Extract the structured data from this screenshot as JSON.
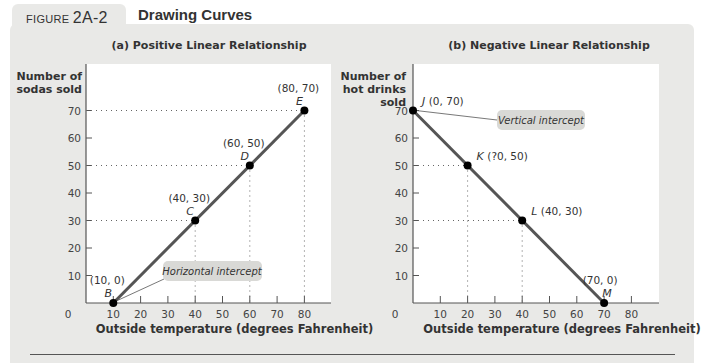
{
  "figure": {
    "label_prefix": "FIGURE",
    "label_number": "2A-2",
    "title": "Drawing Curves"
  },
  "chart_data": [
    {
      "type": "line",
      "title": "(a) Positive Linear Relationship",
      "xlabel": "Outside temperature (degrees Fahrenheit)",
      "ylabel": [
        "Number of",
        "sodas sold"
      ],
      "x_ticks": [
        0,
        10,
        20,
        30,
        40,
        50,
        60,
        70,
        80
      ],
      "y_ticks": [
        10,
        20,
        30,
        40,
        50,
        60,
        70
      ],
      "xlim": [
        0,
        90
      ],
      "ylim": [
        0,
        80
      ],
      "series": [
        {
          "name": "Sodas sold",
          "x": [
            10,
            40,
            60,
            80
          ],
          "y": [
            0,
            30,
            50,
            70
          ]
        }
      ],
      "points": [
        {
          "name": "B",
          "x": 10,
          "y": 0,
          "label": "(10, 0)"
        },
        {
          "name": "C",
          "x": 40,
          "y": 30,
          "label": "(40, 30)"
        },
        {
          "name": "D",
          "x": 60,
          "y": 50,
          "label": "(60, 50)"
        },
        {
          "name": "E",
          "x": 80,
          "y": 70,
          "label": "(80, 70)"
        }
      ],
      "annotations": [
        {
          "text": "Horizontal intercept",
          "points_to": "B"
        }
      ],
      "grid": false
    },
    {
      "type": "line",
      "title": "(b) Negative Linear Relationship",
      "xlabel": "Outside temperature (degrees Fahrenheit)",
      "ylabel": [
        "Number of",
        "hot drinks",
        "sold"
      ],
      "x_ticks": [
        0,
        10,
        20,
        30,
        40,
        50,
        60,
        70,
        80
      ],
      "y_ticks": [
        10,
        20,
        30,
        40,
        50,
        60,
        70
      ],
      "xlim": [
        0,
        90
      ],
      "ylim": [
        0,
        80
      ],
      "series": [
        {
          "name": "Hot drinks sold",
          "x": [
            0,
            20,
            40,
            70
          ],
          "y": [
            70,
            50,
            30,
            0
          ]
        }
      ],
      "points": [
        {
          "name": "J",
          "x": 0,
          "y": 70,
          "label": "(0, 70)"
        },
        {
          "name": "K",
          "x": 20,
          "y": 50,
          "label": "(?0, 50)"
        },
        {
          "name": "L",
          "x": 40,
          "y": 30,
          "label": "(40, 30)"
        },
        {
          "name": "M",
          "x": 70,
          "y": 0,
          "label": "(70, 0)"
        }
      ],
      "annotations": [
        {
          "text": "Vertical intercept",
          "points_to": "J"
        }
      ],
      "grid": false
    }
  ],
  "colors": {
    "panel_bg": "#e9e9e7",
    "plot_bg": "#ffffff",
    "curve": "#555555",
    "point": "#000000",
    "callout_bg": "#d9d9d6",
    "text": "#333333"
  }
}
